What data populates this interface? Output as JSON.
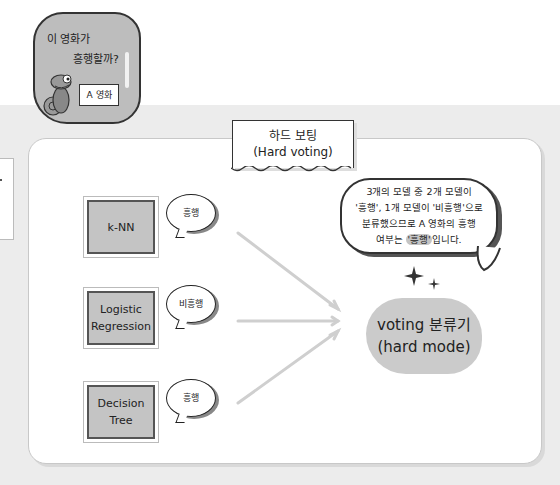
{
  "question_bubble": {
    "line1": "이 영화가",
    "line2": "흥행할까?",
    "sign": "A 영화"
  },
  "title": {
    "korean": "하드 보팅",
    "english": "(Hard voting)"
  },
  "models": [
    {
      "name": "k-NN",
      "vote": "흥행"
    },
    {
      "name": "Logistic Regression",
      "vote": "비흥행"
    },
    {
      "name": "Decision Tree",
      "vote": "흥행"
    }
  ],
  "explanation": {
    "line1": "3개의 모델 중 2개 모델이",
    "line2": "'흥행', 1개 모델이 '비흥행'으로",
    "line3": "분류했으므로 A 영화의 흥행",
    "line4_pre": "여부는 ",
    "line4_hl": "'흥행'",
    "line4_post": "입니다."
  },
  "classifier": {
    "line1": "voting 분류기",
    "line2": "(hard mode)"
  },
  "colors": {
    "panel_bg": "#ffffff",
    "band_bg": "#ececec",
    "model_fill": "#c4c4c4",
    "arrow": "#cfcfcf"
  }
}
